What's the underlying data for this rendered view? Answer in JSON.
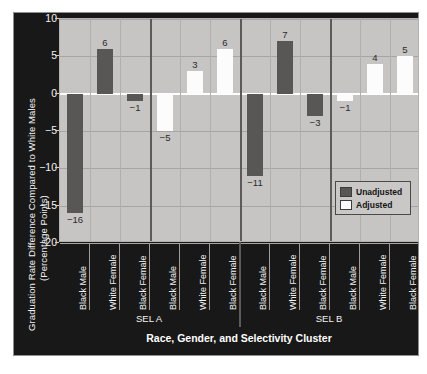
{
  "chart_data": {
    "type": "bar",
    "title": "",
    "xlabel": "Race, Gender, and Selectivity Cluster",
    "ylabel_line1": "Graduation Rate Difference Compared to White Males",
    "ylabel_line2": "(Percentage Points)",
    "ylim": [
      -20,
      10
    ],
    "yticks": [
      10,
      5,
      0,
      -5,
      -10,
      -15,
      -20
    ],
    "ytick_labels": [
      "10",
      "5",
      "0",
      "−5",
      "−10",
      "−15",
      "−20"
    ],
    "grid": true,
    "legend_position": "bottom-right",
    "categories": [
      "Black Male",
      "White Female",
      "Black Female",
      "Black Male",
      "White Female",
      "Black Female",
      "Black Male",
      "White Female",
      "Black Female",
      "Black Male",
      "White Female",
      "Black Female"
    ],
    "clusters": [
      {
        "label": "SEL A",
        "span": [
          0,
          5
        ]
      },
      {
        "label": "SEL B",
        "span": [
          6,
          11
        ]
      }
    ],
    "legend": [
      {
        "name": "Unadjusted",
        "color": "#595756"
      },
      {
        "name": "Adjusted",
        "color": "#fcfcfc"
      }
    ],
    "bars": [
      {
        "category": "Black Male",
        "cluster": "SEL A",
        "series": "Unadjusted",
        "value": -16,
        "label": "−16"
      },
      {
        "category": "White Female",
        "cluster": "SEL A",
        "series": "Unadjusted",
        "value": 6,
        "label": "6"
      },
      {
        "category": "Black Female",
        "cluster": "SEL A",
        "series": "Unadjusted",
        "value": -1,
        "label": "−1"
      },
      {
        "category": "Black Male",
        "cluster": "SEL A",
        "series": "Adjusted",
        "value": -5,
        "label": "−5"
      },
      {
        "category": "White Female",
        "cluster": "SEL A",
        "series": "Adjusted",
        "value": 3,
        "label": "3"
      },
      {
        "category": "Black Female",
        "cluster": "SEL A",
        "series": "Adjusted",
        "value": 6,
        "label": "6"
      },
      {
        "category": "Black Male",
        "cluster": "SEL B",
        "series": "Unadjusted",
        "value": -11,
        "label": "−11"
      },
      {
        "category": "White Female",
        "cluster": "SEL B",
        "series": "Unadjusted",
        "value": 7,
        "label": "7"
      },
      {
        "category": "Black Female",
        "cluster": "SEL B",
        "series": "Unadjusted",
        "value": -3,
        "label": "−3"
      },
      {
        "category": "Black Male",
        "cluster": "SEL B",
        "series": "Adjusted",
        "value": -1,
        "label": "−1"
      },
      {
        "category": "White Female",
        "cluster": "SEL B",
        "series": "Adjusted",
        "value": 4,
        "label": "4"
      },
      {
        "category": "Black Female",
        "cluster": "SEL B",
        "series": "Adjusted",
        "value": 5,
        "label": "5"
      }
    ]
  },
  "colors": {
    "panel_background": "#191818",
    "plot_background": "#c6c5c3",
    "unadjusted": "#595756",
    "adjusted": "#fcfcfc",
    "zero_line": "#ffffff",
    "grid": "#a6a5a3",
    "separator": "#5c5b59",
    "text_light": "#f2f2f2"
  }
}
